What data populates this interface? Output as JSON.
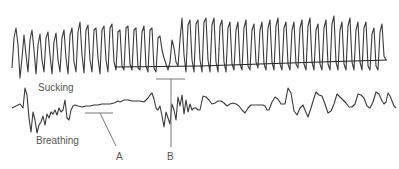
{
  "figure": {
    "trace_color": "#3a3a3a",
    "marker_color": "#777777",
    "labels": {
      "sucking": "Sucking",
      "breathing": "Breathing",
      "marker_a": "A",
      "marker_b": "B"
    }
  }
}
